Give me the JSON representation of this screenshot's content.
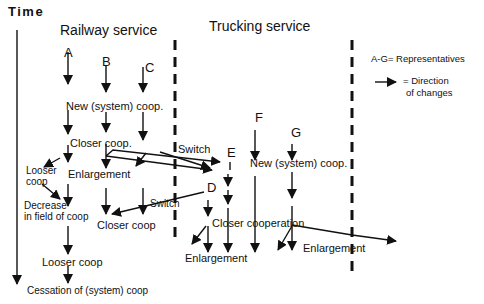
{
  "axis": {
    "time_label": "Time"
  },
  "sections": {
    "railway": "Railway service",
    "trucking": "Trucking service"
  },
  "representatives": {
    "A": "A",
    "B": "B",
    "C": "C",
    "D": "D",
    "E": "E",
    "F": "F",
    "G": "G"
  },
  "legend": {
    "representatives": "A-G=  Representatives",
    "direction_line1": "=  Direction",
    "direction_line2": "of changes"
  },
  "nodes": {
    "rail_new_coop": "New (system)  coop.",
    "rail_closer_coop_1": "Closer coop.",
    "rail_looser_coop_1a": "Looser",
    "rail_looser_coop_1b": "coop",
    "rail_enlargement": "Enlargement",
    "rail_decrease_a": "Decrease",
    "rail_decrease_b": "in field of coop",
    "rail_closer_coop_2": "Closer coop",
    "rail_looser_coop_2": "Looser coop",
    "rail_cessation": "Cessation of (system) coop",
    "truck_new_coop": "New (system) coop.",
    "truck_closer_cooperation": "Closer cooperation",
    "truck_enlargement_1": "Enlargement",
    "truck_enlargement_2": "Enlargement",
    "switch_1": "Switch",
    "switch_2": "Switch"
  },
  "colors": {
    "ink": "#111111",
    "background": "#ffffff"
  }
}
